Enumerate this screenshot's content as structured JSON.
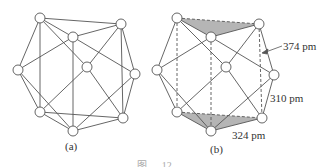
{
  "panels": [
    {
      "id": "a",
      "caption": "(a)"
    },
    {
      "id": "b",
      "caption": "(b)"
    }
  ],
  "annotations": {
    "d1": "374 pm",
    "d2": "310 pm",
    "d3": "324 pm"
  },
  "figure_caption": "图 … 12 …",
  "colors": {
    "line": "#555555",
    "shade": "#b5b5b5",
    "node_fill": "#ffffff"
  }
}
